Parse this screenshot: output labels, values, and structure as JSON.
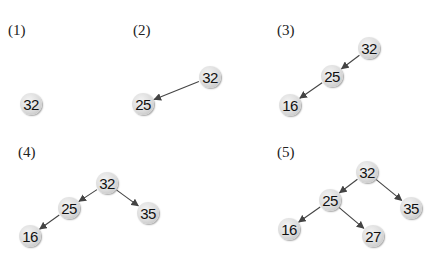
{
  "colors": {
    "node_fill": "#dcdcdc",
    "edge": "#444444",
    "text": "#111111"
  },
  "steps": [
    {
      "label": "(1)",
      "label_pos": [
        8,
        23
      ],
      "nodes": [
        {
          "id": "a",
          "value": "32",
          "x": 31,
          "y": 104
        }
      ],
      "edges": []
    },
    {
      "label": "(2)",
      "label_pos": [
        133,
        23
      ],
      "nodes": [
        {
          "id": "a",
          "value": "32",
          "x": 210,
          "y": 77
        },
        {
          "id": "b",
          "value": "25",
          "x": 143,
          "y": 104
        }
      ],
      "edges": [
        [
          "a",
          "b"
        ]
      ]
    },
    {
      "label": "(3)",
      "label_pos": [
        277,
        23
      ],
      "nodes": [
        {
          "id": "a",
          "value": "32",
          "x": 369,
          "y": 48
        },
        {
          "id": "b",
          "value": "25",
          "x": 332,
          "y": 76
        },
        {
          "id": "c",
          "value": "16",
          "x": 290,
          "y": 105
        }
      ],
      "edges": [
        [
          "a",
          "b"
        ],
        [
          "b",
          "c"
        ]
      ]
    },
    {
      "label": "(4)",
      "label_pos": [
        18,
        145
      ],
      "nodes": [
        {
          "id": "a",
          "value": "32",
          "x": 107,
          "y": 183
        },
        {
          "id": "b",
          "value": "25",
          "x": 69,
          "y": 208
        },
        {
          "id": "d",
          "value": "35",
          "x": 148,
          "y": 213
        },
        {
          "id": "c",
          "value": "16",
          "x": 30,
          "y": 236
        }
      ],
      "edges": [
        [
          "a",
          "b"
        ],
        [
          "a",
          "d"
        ],
        [
          "b",
          "c"
        ]
      ]
    },
    {
      "label": "(5)",
      "label_pos": [
        277,
        145
      ],
      "nodes": [
        {
          "id": "a",
          "value": "32",
          "x": 367,
          "y": 172
        },
        {
          "id": "b",
          "value": "25",
          "x": 330,
          "y": 200
        },
        {
          "id": "d",
          "value": "35",
          "x": 411,
          "y": 208
        },
        {
          "id": "c",
          "value": "16",
          "x": 289,
          "y": 229
        },
        {
          "id": "e",
          "value": "27",
          "x": 373,
          "y": 236
        }
      ],
      "edges": [
        [
          "a",
          "b"
        ],
        [
          "a",
          "d"
        ],
        [
          "b",
          "c"
        ],
        [
          "b",
          "e"
        ]
      ]
    }
  ]
}
